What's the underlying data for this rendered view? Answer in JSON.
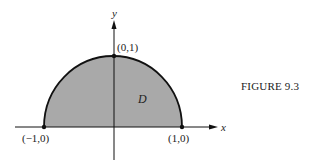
{
  "figure": {
    "caption": "FIGURE 9.3",
    "region_label": "D",
    "axes": {
      "x_label": "x",
      "y_label": "y"
    },
    "points": [
      {
        "label": "(0,1)"
      },
      {
        "label": "(−1,0)"
      },
      {
        "label": "(1,0)"
      }
    ],
    "colors": {
      "region_fill": "#a9a9a9",
      "stroke": "#111111"
    }
  }
}
